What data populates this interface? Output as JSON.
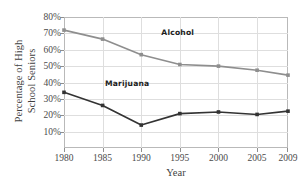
{
  "chart_data": {
    "type": "line",
    "title": "",
    "xlabel": "Year",
    "ylabel_line1": "Percentage of High",
    "ylabel_line2": "School Seniors",
    "x": [
      1980,
      1985,
      1990,
      1995,
      2000,
      2005,
      2009
    ],
    "xtick_labels": [
      "1980",
      "1985",
      "1990",
      "1995",
      "2000",
      "2005",
      "2009"
    ],
    "ytick_labels": [
      "10%",
      "20%",
      "30%",
      "40%",
      "50%",
      "60%",
      "70%",
      "80%"
    ],
    "ytick_values": [
      10,
      20,
      30,
      40,
      50,
      60,
      70,
      80
    ],
    "ylim": [
      0,
      80
    ],
    "xlim": [
      1980,
      2009
    ],
    "grid": true,
    "legend_position": "inline-annotations",
    "series": [
      {
        "name": "Alcohol",
        "color": "#8e8e8e",
        "marker": "square",
        "values": [
          72,
          66.5,
          57,
          51,
          50,
          47.5,
          44.5
        ],
        "annotation": "Alcohol",
        "annotation_x": 1992.6,
        "annotation_y": 70
      },
      {
        "name": "Marijuana",
        "color": "#333333",
        "marker": "square",
        "values": [
          34,
          26,
          14,
          21,
          22,
          20.5,
          22.5
        ],
        "annotation": "Marijuana",
        "annotation_x": 1985.3,
        "annotation_y": 39
      }
    ]
  }
}
